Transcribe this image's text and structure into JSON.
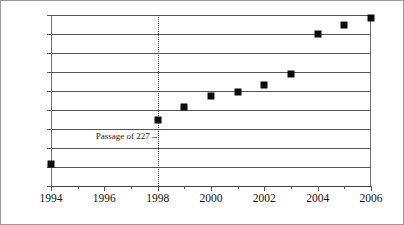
{
  "chart_data": {
    "type": "scatter",
    "title": "",
    "subtitle": "",
    "xlabel": "",
    "ylabel": "",
    "xlim": [
      1994,
      2006
    ],
    "ylim": [
      25,
      205
    ],
    "grid": true,
    "legend": "none",
    "x": [
      1994,
      1998,
      1999,
      2000,
      2001,
      2002,
      2003,
      2004,
      2005,
      2006
    ],
    "values": [
      48,
      95,
      108,
      120,
      124,
      131,
      143,
      185,
      195,
      202
    ],
    "series": [
      {
        "name": "series-1",
        "marker": "filled-square",
        "color": "#0a0a0a",
        "points": [
          {
            "x": 1994,
            "y": 48
          },
          {
            "x": 1998,
            "y": 95
          },
          {
            "x": 1999,
            "y": 108
          },
          {
            "x": 2000,
            "y": 120
          },
          {
            "x": 2001,
            "y": 124
          },
          {
            "x": 2002,
            "y": 131
          },
          {
            "x": 2003,
            "y": 143
          },
          {
            "x": 2004,
            "y": 185
          },
          {
            "x": 2005,
            "y": 195
          },
          {
            "x": 2006,
            "y": 202
          }
        ]
      }
    ],
    "yticks": [
      25,
      45,
      65,
      85,
      105,
      125,
      145,
      165,
      185,
      205
    ],
    "ytick_labels": [
      "25",
      "45",
      "65",
      "85",
      "105",
      "125",
      "145",
      "165",
      "185",
      "205"
    ],
    "xticks_major": [
      1994,
      1996,
      1998,
      2000,
      2002,
      2004,
      2006
    ],
    "xtick_labels": [
      "1994",
      "1996",
      "1998",
      "2000",
      "2002",
      "2004",
      "2006"
    ],
    "xticks_minor": [
      1995,
      1997,
      1999,
      2001,
      2003,
      2005
    ],
    "annotations": [
      {
        "name": "passage-of-227",
        "text": "Passage of 227→",
        "x": 1998,
        "y": 78,
        "line": "dotted-vertical",
        "line_color": "#3a3a3a"
      }
    ]
  }
}
